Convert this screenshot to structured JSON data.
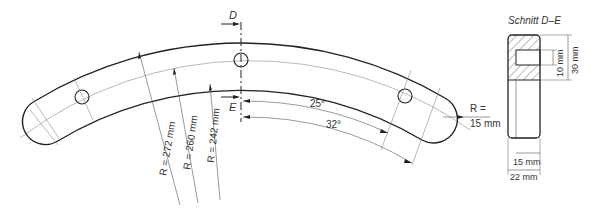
{
  "drawing": {
    "type": "technical-drawing",
    "part": "curved bar with three holes",
    "section_marks": {
      "top": "D",
      "bottom": "E"
    },
    "radii": {
      "outer": "R = 272 mm",
      "center": "R = 260 mm",
      "inner": "R = 242 mm",
      "end": {
        "line1": "R =",
        "line2": "15 mm"
      }
    },
    "angles": {
      "holes": "25°",
      "ends": "32°"
    }
  },
  "section": {
    "title": "Schnitt D–E",
    "dims": {
      "slot_height": "10 mm",
      "total_height": "30 mm",
      "slot_width": "15 mm",
      "total_width": "22 mm"
    }
  },
  "colors": {
    "line": "#222222",
    "thin": "#777777",
    "text": "#333333"
  }
}
